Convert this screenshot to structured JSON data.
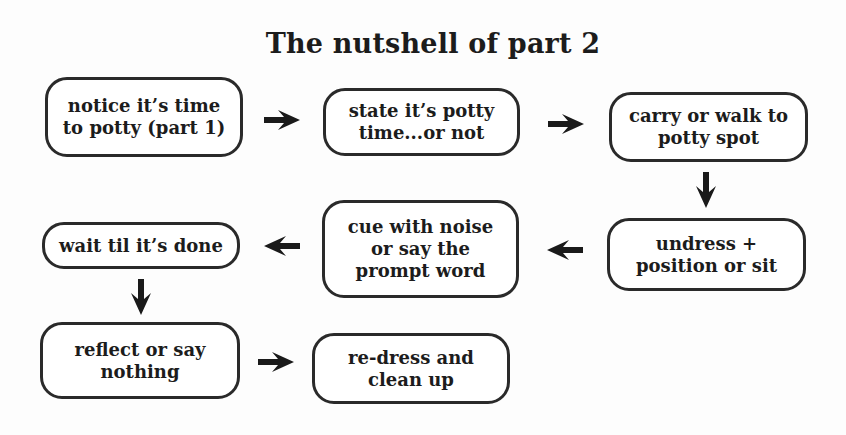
{
  "title": "The nutshell of part 2",
  "steps": [
    {
      "id": 1,
      "label": "notice it’s time\nto potty (part 1)"
    },
    {
      "id": 2,
      "label": "state it’s potty\ntime...or not"
    },
    {
      "id": 3,
      "label": "carry or walk to\npotty spot"
    },
    {
      "id": 4,
      "label": "undress +\nposition or sit"
    },
    {
      "id": 5,
      "label": "cue with noise\nor say the\nprompt word"
    },
    {
      "id": 6,
      "label": "wait til it’s done"
    },
    {
      "id": 7,
      "label": "reflect or say\nnothing"
    },
    {
      "id": 8,
      "label": "re-dress and\nclean up"
    }
  ],
  "arrows": [
    {
      "from": 1,
      "to": 2,
      "direction": "right"
    },
    {
      "from": 2,
      "to": 3,
      "direction": "right"
    },
    {
      "from": 3,
      "to": 4,
      "direction": "down"
    },
    {
      "from": 4,
      "to": 5,
      "direction": "left"
    },
    {
      "from": 5,
      "to": 6,
      "direction": "left"
    },
    {
      "from": 6,
      "to": 7,
      "direction": "down"
    },
    {
      "from": 7,
      "to": 8,
      "direction": "right"
    }
  ]
}
